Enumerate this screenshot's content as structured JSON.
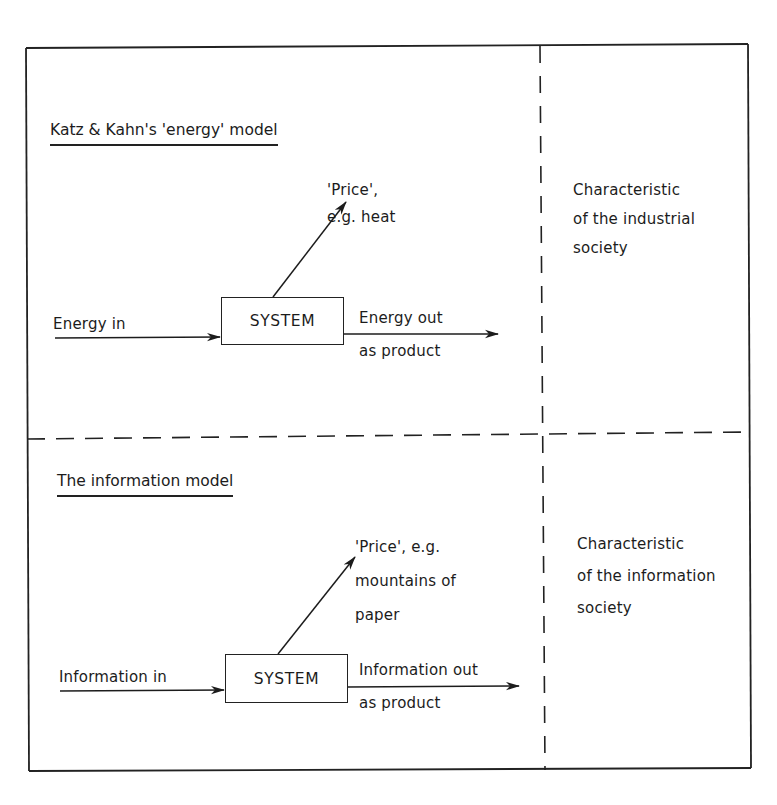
{
  "figure": {
    "panels": [
      {
        "id": "energy",
        "heading": "Katz & Kahn's 'energy' model",
        "system_label": "SYSTEM",
        "input_label": "Energy in",
        "output_label_line1": "Energy out",
        "output_label_line2": "as product",
        "price_lines": [
          "'Price',",
          "e.g. heat"
        ],
        "characteristic_lines": [
          "Characteristic",
          "of the industrial",
          "society"
        ]
      },
      {
        "id": "information",
        "heading": "The information model",
        "system_label": "SYSTEM",
        "input_label": "Information in",
        "output_label_line1": "Information out",
        "output_label_line2": "as product",
        "price_lines": [
          "'Price', e.g.",
          "mountains of",
          "paper"
        ],
        "characteristic_lines": [
          "Characteristic",
          "of the information",
          "society"
        ]
      }
    ],
    "colors": {
      "ink": "#1c1c1c",
      "background": "#ffffff"
    }
  }
}
